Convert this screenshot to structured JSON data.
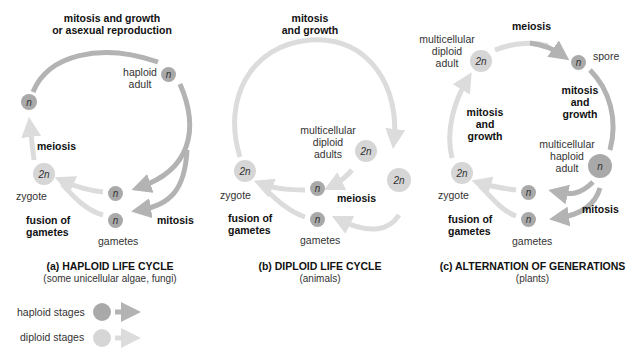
{
  "colors": {
    "haploid": "#a9a9a9",
    "diploid": "#d6d6d6",
    "haploid_arrow": "#b3b3b3",
    "diploid_arrow": "#dcdcdc"
  },
  "panels": [
    {
      "id": "a",
      "title": "(a) HAPLOID LIFE CYCLE",
      "subtitle": "(some unicellular algae, fungi)",
      "labels": {
        "top_process": "mitosis and growth",
        "top_process_2": "or asexual reproduction",
        "adult": "haploid",
        "adult_2": "adult",
        "meiosis": "meiosis",
        "zygote": "zygote",
        "fusion": "fusion of",
        "fusion_2": "gametes",
        "gametes": "gametes",
        "mitosis": "mitosis"
      },
      "cells": {
        "adult": "n",
        "meiosis_product": "n",
        "zygote": "2n",
        "gamete_1": "n",
        "gamete_2": "n"
      }
    },
    {
      "id": "b",
      "title": "(b) DIPLOID LIFE CYCLE",
      "subtitle": "(animals)",
      "labels": {
        "top_process": "mitosis",
        "top_process_2": "and growth",
        "adults": "multicellular",
        "adults_2": "diploid",
        "adults_3": "adults",
        "meiosis": "meiosis",
        "zygote": "zygote",
        "fusion": "fusion of",
        "fusion_2": "gametes",
        "gametes": "gametes"
      },
      "cells": {
        "adult_1": "2n",
        "adult_2": "2n",
        "zygote": "2n",
        "gamete_1": "n",
        "gamete_2": "n"
      }
    },
    {
      "id": "c",
      "title": "(c) ALTERNATION OF GENERATIONS",
      "subtitle": "(plants)",
      "labels": {
        "meiosis": "meiosis",
        "diploid_adult": "multicellular",
        "diploid_adult_2": "diploid",
        "diploid_adult_3": "adult",
        "spore": "spore",
        "right_process": "mitosis",
        "right_process_2": "and",
        "right_process_3": "growth",
        "left_process": "mitosis",
        "left_process_2": "and",
        "left_process_3": "growth",
        "haploid_adult": "multicellular",
        "haploid_adult_2": "haploid",
        "haploid_adult_3": "adult",
        "zygote": "zygote",
        "fusion": "fusion of",
        "fusion_2": "gametes",
        "gametes": "gametes",
        "mitosis": "mitosis"
      },
      "cells": {
        "diploid_adult": "2n",
        "spore": "n",
        "haploid_adult": "n",
        "zygote": "2n",
        "gamete_1": "n",
        "gamete_2": "n"
      }
    }
  ],
  "legend": {
    "items": [
      {
        "label": "haploid stages",
        "kind": "haploid"
      },
      {
        "label": "diploid stages",
        "kind": "diploid"
      }
    ]
  }
}
